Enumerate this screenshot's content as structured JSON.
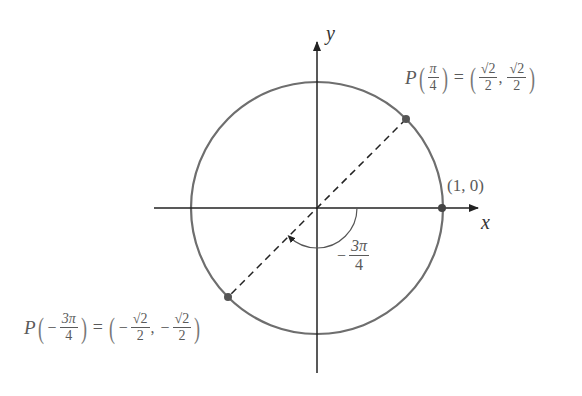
{
  "diagram": {
    "type": "unit-circle",
    "axes": {
      "x_label": "x",
      "y_label": "y"
    },
    "circle": {
      "center": [
        317,
        208
      ],
      "radius": 126,
      "stroke": "#6e6e6e"
    },
    "points": [
      {
        "name": "point-pi-over-4",
        "label_prefix": "P",
        "arg_num": "π",
        "arg_den": "4",
        "coord_x_num": "√2",
        "coord_x_den": "2",
        "coord_y_num": "√2",
        "coord_y_den": "2",
        "sign": "",
        "position": [
          406,
          119
        ]
      },
      {
        "name": "point-minus-3pi-over-4",
        "label_prefix": "P",
        "arg_sign": "−",
        "arg_num": "3π",
        "arg_den": "4",
        "coord_sign": "−",
        "coord_x_num": "√2",
        "coord_x_den": "2",
        "coord_y_num": "√2",
        "coord_y_den": "2",
        "position": [
          228,
          297
        ]
      },
      {
        "name": "point-1-0",
        "label": "(1, 0)",
        "position": [
          442,
          208
        ]
      }
    ],
    "angle_label": {
      "sign": "−",
      "num": "3π",
      "den": "4"
    },
    "equals": "=",
    "comma": ","
  }
}
